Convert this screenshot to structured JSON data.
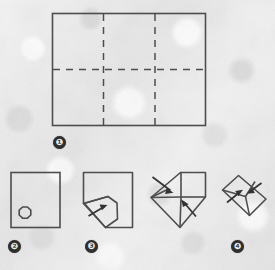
{
  "figure": {
    "kind": "origami-folding-instruction-diagram",
    "background_color": "#e9e9e9",
    "ink_color": "#4a4a4a",
    "label_fill_color": "#2e2e2e",
    "label_text_color": "#ececec",
    "panel_count": 5,
    "step_labels": [
      {
        "id": "step-1",
        "text": "❶",
        "number": 1
      },
      {
        "id": "step-2",
        "text": "❷",
        "number": 2
      },
      {
        "id": "step-3",
        "text": "❸",
        "number": 3
      },
      {
        "id": "step-4",
        "text": "❹",
        "number": 4
      }
    ],
    "panels": [
      {
        "id": "panel-1",
        "label_number": 1,
        "description": "Large landscape rectangle divided by dashed crease lines into three columns and two rows",
        "solid_outline": true,
        "dashed_creases": {
          "vertical_count": 2,
          "horizontal_count": 1
        }
      },
      {
        "id": "panel-2",
        "label_number": 2,
        "description": "Small square sheet with a small octagon mark near the lower-left corner",
        "solid_outline": true,
        "marker_shape": "octagon"
      },
      {
        "id": "panel-3",
        "label_number": 3,
        "description": "Square sheet with the lower-left corner folded outward, one arrow indicating the fold direction",
        "solid_outline": true,
        "arrow_count": 1
      },
      {
        "id": "panel-4",
        "label_number": 4,
        "description": "Partially folded diamond/envelope form with two arrows showing corners folding inward",
        "solid_outline": true,
        "arrow_count": 2
      },
      {
        "id": "panel-5",
        "label_number": 4,
        "description": "Completed tilted envelope shape with two arrows indicating final tuck",
        "solid_outline": true,
        "arrow_count": 2
      }
    ]
  }
}
